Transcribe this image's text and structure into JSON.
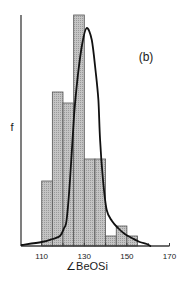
{
  "chart_data": {
    "type": "bar",
    "subtype": "histogram-with-fitted-curve",
    "panel_label": "(b)",
    "title": "",
    "xlabel": "∠BeOSi",
    "ylabel": "f",
    "xlim": [
      100,
      170
    ],
    "ylim": [
      0,
      23.1
    ],
    "x_ticks": [
      110,
      120,
      130,
      140,
      150,
      160,
      170
    ],
    "x_tick_labels": [
      {
        "value": 110,
        "label": "110"
      },
      {
        "value": 130,
        "label": "130"
      },
      {
        "value": 150,
        "label": "150"
      },
      {
        "value": 170,
        "label": "170"
      }
    ],
    "grid": false,
    "legend": null,
    "histogram": {
      "bins": [
        {
          "from": 110,
          "to": 115,
          "value": 6.5
        },
        {
          "from": 115,
          "to": 120,
          "value": 15.4
        },
        {
          "from": 120,
          "to": 125,
          "value": 14.3
        },
        {
          "from": 125,
          "to": 130,
          "value": 23.1
        },
        {
          "from": 130,
          "to": 135,
          "value": 8.7
        },
        {
          "from": 135,
          "to": 140,
          "value": 8.7
        },
        {
          "from": 140,
          "to": 145,
          "value": 1.0
        },
        {
          "from": 145,
          "to": 150,
          "value": 2.0
        },
        {
          "from": 150,
          "to": 155,
          "value": 1.0
        }
      ],
      "fill": "#b9b9b9",
      "stroke": "#555555"
    },
    "curve": {
      "name": "fitted distribution",
      "points": [
        [
          100.6,
          0.1
        ],
        [
          110,
          0.4
        ],
        [
          115,
          0.7
        ],
        [
          118.6,
          1.0
        ],
        [
          120.5,
          1.8
        ],
        [
          121.7,
          2.6
        ],
        [
          123.3,
          6.6
        ],
        [
          125.2,
          13.1
        ],
        [
          127.0,
          17.1
        ],
        [
          129.0,
          20.2
        ],
        [
          131.1,
          21.8
        ],
        [
          133.5,
          20.6
        ],
        [
          135.3,
          17.5
        ],
        [
          136.6,
          14.6
        ],
        [
          137.4,
          10.6
        ],
        [
          138.8,
          6.6
        ],
        [
          140.5,
          3.6
        ],
        [
          143.0,
          2.5
        ],
        [
          145.8,
          1.8
        ],
        [
          149.0,
          1.2
        ],
        [
          152.3,
          0.8
        ],
        [
          156.0,
          0.4
        ],
        [
          159.3,
          0.2
        ],
        [
          161.0,
          0.0
        ]
      ],
      "color": "#111111"
    }
  }
}
